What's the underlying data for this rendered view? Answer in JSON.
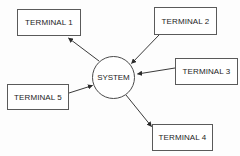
{
  "diagram": {
    "type": "star-topology-block-diagram",
    "canvas": {
      "width": 240,
      "height": 156
    },
    "colors": {
      "background": "#fdfdfd",
      "node_fill": "#ffffff",
      "node_stroke": "#5a5a5a",
      "hub_stroke": "#4a4a4a",
      "connector_stroke": "#3a3a3a",
      "text": "#1d1d1d"
    },
    "hub": {
      "id": "system",
      "label": "SYSTEM",
      "shape": "circle",
      "cx": 113.5,
      "cy": 77.5,
      "r": 21.5
    },
    "nodes": [
      {
        "id": "terminal-1",
        "label": "TERMINAL 1",
        "shape": "rectangle",
        "x": 17,
        "y": 9,
        "width": 64,
        "height": 27
      },
      {
        "id": "terminal-2",
        "label": "TERMINAL 2",
        "shape": "rectangle",
        "x": 154,
        "y": 7,
        "width": 63,
        "height": 28
      },
      {
        "id": "terminal-3",
        "label": "TERMINAL 3",
        "shape": "rectangle",
        "x": 175,
        "y": 58,
        "width": 63,
        "height": 27
      },
      {
        "id": "terminal-4",
        "label": "TERMINAL 4",
        "shape": "rectangle",
        "x": 152,
        "y": 124,
        "width": 61,
        "height": 27
      },
      {
        "id": "terminal-5",
        "label": "TERMINAL 5",
        "shape": "rectangle",
        "x": 7,
        "y": 84,
        "width": 62,
        "height": 26
      }
    ],
    "connectors": [
      {
        "id": "system-to-terminal-1",
        "from": "system",
        "to": "terminal-1",
        "direction": "outbound",
        "arrowhead_at": "terminal-1",
        "x1": 99,
        "y1": 61,
        "x2": 67,
        "y2": 37
      },
      {
        "id": "terminal-2-to-system",
        "from": "terminal-2",
        "to": "system",
        "direction": "inbound",
        "arrowhead_at": "system",
        "x1": 159,
        "y1": 35,
        "x2": 130,
        "y2": 62
      },
      {
        "id": "terminal-3-to-system",
        "from": "terminal-3",
        "to": "system",
        "direction": "inbound",
        "arrowhead_at": "system",
        "x1": 175,
        "y1": 68,
        "x2": 136,
        "y2": 74
      },
      {
        "id": "system-to-terminal-4",
        "from": "system",
        "to": "terminal-4",
        "direction": "outbound",
        "arrowhead_at": "terminal-4",
        "x1": 126,
        "y1": 95,
        "x2": 153,
        "y2": 128
      },
      {
        "id": "terminal-5-to-system",
        "from": "terminal-5",
        "to": "system",
        "direction": "inbound",
        "arrowhead_at": "system",
        "x1": 69,
        "y1": 93,
        "x2": 94,
        "y2": 85
      }
    ]
  }
}
